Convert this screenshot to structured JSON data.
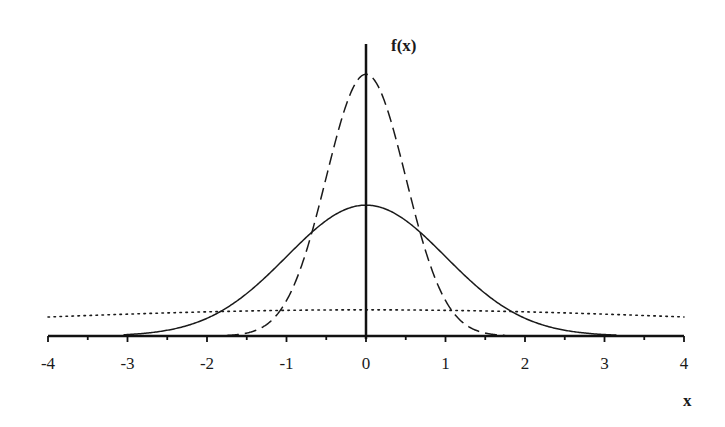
{
  "chart_data": {
    "type": "line",
    "title": "",
    "xlabel": "x",
    "ylabel": "f(x)",
    "xlim": [
      -4,
      4
    ],
    "x_ticks": [
      -4,
      -3,
      -2,
      -1,
      0,
      1,
      2,
      3,
      4
    ],
    "x_tick_labels": [
      "-4",
      "-3",
      "-2",
      "-1",
      "0",
      "1",
      "2",
      "3",
      "4"
    ],
    "grid": false,
    "legend": null,
    "series": [
      {
        "name": "normal density, sigma = 0.5",
        "style": "dashed",
        "mean": 0,
        "sd": 0.5,
        "x": [
          -2,
          -1.5,
          -1,
          -0.5,
          0,
          0.5,
          1,
          1.5,
          2
        ],
        "values": [
          0.0003,
          0.0089,
          0.108,
          0.484,
          0.798,
          0.484,
          0.108,
          0.0089,
          0.0003
        ]
      },
      {
        "name": "normal density, sigma = 1",
        "style": "solid",
        "mean": 0,
        "sd": 1,
        "x": [
          -3,
          -2,
          -1,
          0,
          1,
          2,
          3
        ],
        "values": [
          0.0044,
          0.054,
          0.242,
          0.399,
          0.242,
          0.054,
          0.0044
        ]
      },
      {
        "name": "normal density, sigma = 5",
        "style": "dotted",
        "mean": 0,
        "sd": 5,
        "x": [
          -4,
          -2,
          0,
          2,
          4
        ],
        "values": [
          0.058,
          0.073,
          0.08,
          0.073,
          0.058
        ]
      }
    ]
  },
  "labels": {
    "y_axis": "f(x)",
    "x_axis": "x",
    "ticks": [
      "-4",
      "-3",
      "-2",
      "-1",
      "0",
      "1",
      "2",
      "3",
      "4"
    ]
  }
}
